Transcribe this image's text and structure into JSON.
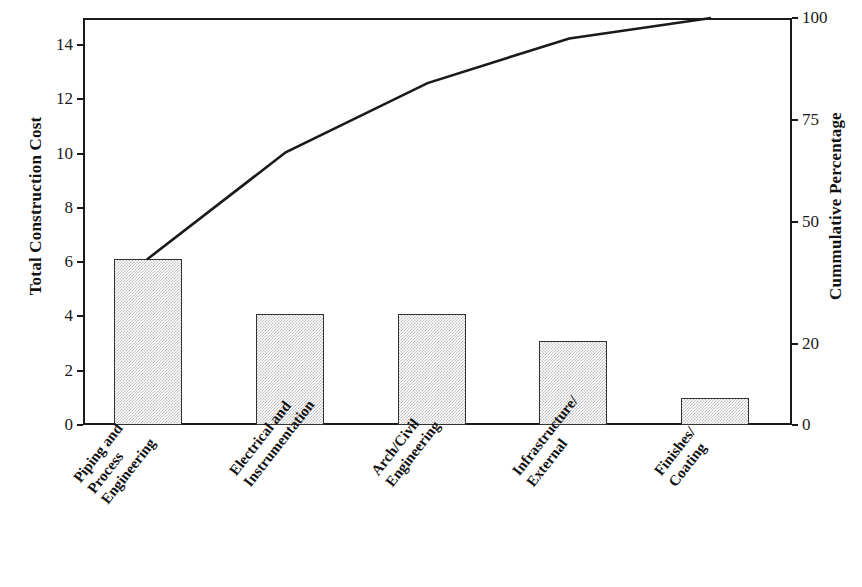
{
  "chart_data": {
    "type": "bar",
    "title": "",
    "subtitle": "",
    "xlabel": "",
    "ylabel": "Total Construction Cost",
    "y2label": "Cummulative Percentage",
    "grid": false,
    "legend": "none",
    "categories": [
      "Piping and Process Engineering",
      "Electrical and Instrumentation",
      "Arch/Civil Engineering",
      "Infrastructure/ External",
      "Finishes/ Coating"
    ],
    "category_lines": [
      [
        "Piping and",
        "Process",
        "Engineering"
      ],
      [
        "Electrical and",
        "Instrumentation"
      ],
      [
        "Arch/Civil",
        "Engineering"
      ],
      [
        "Infrastructure/",
        "External"
      ],
      [
        "Finishes/",
        "Coating"
      ]
    ],
    "series": [
      {
        "name": "Total Construction Cost",
        "type": "bar",
        "axis": "left",
        "values": [
          6.1,
          4.1,
          4.1,
          3.1,
          1.0
        ]
      },
      {
        "name": "Cummulative Percentage",
        "type": "line",
        "axis": "right",
        "values": [
          40,
          67,
          84,
          95,
          100
        ]
      }
    ],
    "ylim": [
      0,
      15
    ],
    "y2lim": [
      0,
      100
    ],
    "yticks": [
      0,
      2,
      4,
      6,
      8,
      10,
      12,
      14
    ],
    "ytick_labels": [
      "0",
      "2",
      "4",
      "6",
      "8",
      "10",
      "12",
      "14"
    ],
    "y2ticks": [
      0,
      20,
      50,
      75,
      100
    ],
    "y2tick_labels": [
      "0",
      "20",
      "50",
      "75",
      "100"
    ],
    "bar_fill": "#bdbdbd",
    "bar_edge": "#333333",
    "line_color": "#1a1a1a",
    "axis_color": "#1a1a1a"
  }
}
